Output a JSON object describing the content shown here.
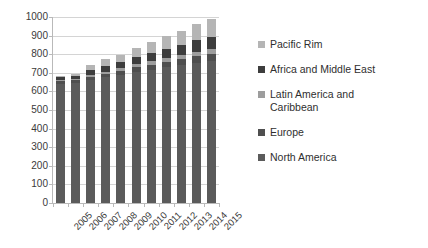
{
  "chart_data": {
    "type": "bar",
    "subtype": "stacked-column",
    "title": "",
    "xlabel": "",
    "ylabel": "",
    "ylim": [
      0,
      1000
    ],
    "ytick_step": 100,
    "ytick_labels": [
      "1000",
      "900",
      "800",
      "700",
      "600",
      "500",
      "400",
      "300",
      "200",
      "100",
      "0"
    ],
    "grid": true,
    "legend_position": "right",
    "categories": [
      "2005",
      "2006",
      "2007",
      "2008",
      "2009",
      "2010",
      "2011",
      "2012",
      "2013",
      "2014",
      "2015"
    ],
    "series": [
      {
        "name": "North America",
        "color": "#5b5b5b",
        "values": [
          640,
          645,
          660,
          675,
          690,
          705,
          715,
          730,
          740,
          755,
          765
        ]
      },
      {
        "name": "Europe",
        "color": "#4f4f4f",
        "values": [
          15,
          15,
          18,
          20,
          22,
          25,
          28,
          30,
          32,
          34,
          36
        ]
      },
      {
        "name": "Latin America and\nCaribbean",
        "color": "#9d9d9d",
        "values": [
          8,
          8,
          10,
          12,
          14,
          16,
          18,
          20,
          22,
          24,
          26
        ]
      },
      {
        "name": "Africa and Middle East",
        "color": "#3d3d3d",
        "values": [
          14,
          16,
          25,
          30,
          32,
          38,
          44,
          50,
          56,
          62,
          68
        ]
      },
      {
        "name": "Pacific Rim",
        "color": "#b5b5b5",
        "values": [
          8,
          12,
          30,
          38,
          40,
          50,
          60,
          68,
          75,
          85,
          95
        ]
      }
    ],
    "totals": [
      685,
      696,
      743,
      775,
      798,
      834,
      865,
      898,
      925,
      960,
      990
    ]
  },
  "legend": {
    "items": [
      {
        "label": "Pacific Rim",
        "color": "#b5b5b5"
      },
      {
        "label": "Africa and Middle East",
        "color": "#3d3d3d"
      },
      {
        "label": "Latin America and\nCaribbean",
        "color": "#9d9d9d"
      },
      {
        "label": "Europe",
        "color": "#4f4f4f"
      },
      {
        "label": "North America",
        "color": "#5b5b5b"
      }
    ]
  },
  "axis": {
    "y_labels": [
      "1000",
      "900",
      "800",
      "700",
      "600",
      "500",
      "400",
      "300",
      "200",
      "100",
      "0"
    ],
    "x_labels": [
      "2005",
      "2006",
      "2007",
      "2008",
      "2009",
      "2010",
      "2011",
      "2012",
      "2013",
      "2014",
      "2015"
    ]
  },
  "colors": {
    "gridline": "#d4d4d4",
    "axis": "#b9b9b9",
    "text": "#333333",
    "background": "#ffffff"
  }
}
